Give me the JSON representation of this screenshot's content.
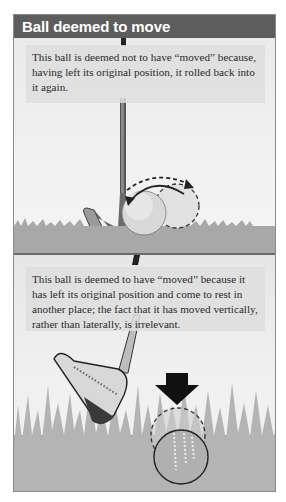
{
  "header": {
    "title": "Ball deemed to move",
    "background_color": "#5d5d5d"
  },
  "panels": [
    {
      "caption": "This ball is deemed not to have “moved” because, having left its original position, it rolled back into it again.",
      "illustration": {
        "objects": [
          "iron-club",
          "golf-ball-current",
          "golf-ball-dashed-outline",
          "curved-arrow-solid-left",
          "curved-arrow-dashed-right",
          "short-grass"
        ]
      }
    },
    {
      "caption": "This ball is deemed to have “moved” because it has left its original position and come to rest in another place; the fact that it has moved vertically, rather than laterally, is irrelevant.",
      "illustration": {
        "objects": [
          "wedge-club",
          "down-arrow",
          "golf-ball-dashed-outline-original",
          "golf-ball-sunken-current",
          "tall-grass"
        ]
      }
    }
  ],
  "colors": {
    "frame_border": "#8a8a8a",
    "panel_bg": "#eeeeee",
    "ground": "#a8a8a8",
    "grass": "#b4b4b4"
  }
}
